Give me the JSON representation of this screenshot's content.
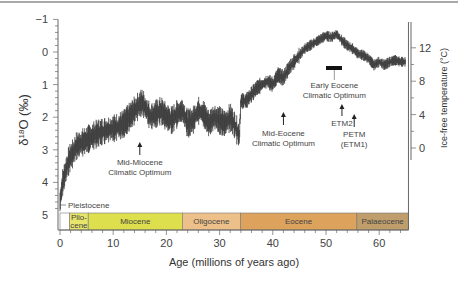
{
  "chart_data": {
    "type": "scatter",
    "title": "",
    "xlabel": "Age (millions of years ago)",
    "ylabel": "δ18O (‰)",
    "y2label": "Ice-free temperature (°C)",
    "xlim": [
      0,
      65.5
    ],
    "ylim": [
      5,
      -1
    ],
    "y2lim": [
      0,
      12
    ],
    "x_ticks": [
      0,
      10,
      20,
      30,
      40,
      50,
      60
    ],
    "y_ticks": [
      -1,
      0,
      1,
      2,
      3,
      4,
      5
    ],
    "y2_ticks": [
      0,
      4,
      8,
      12
    ],
    "grid": false,
    "series": [
      {
        "name": "Benthic δ18O",
        "x": [
          0,
          0.5,
          1,
          1.5,
          2,
          2.5,
          3,
          4,
          5,
          6,
          7,
          8,
          9,
          10,
          11,
          12,
          13,
          14,
          15,
          15.5,
          16,
          17,
          18,
          19,
          20,
          21,
          22,
          23,
          24,
          25,
          26,
          27,
          28,
          29,
          30,
          31,
          32,
          33,
          33.7,
          34,
          35,
          36,
          37,
          38,
          39,
          40,
          41,
          42,
          43,
          44,
          45,
          46,
          47,
          48,
          49,
          50,
          51,
          52,
          53,
          54,
          55,
          56,
          57,
          58,
          59,
          60,
          61,
          62,
          63,
          64,
          65
        ],
        "values": [
          4.6,
          4.0,
          3.7,
          3.4,
          3.2,
          3.1,
          2.9,
          2.8,
          2.7,
          2.6,
          2.5,
          2.45,
          2.4,
          2.35,
          2.3,
          2.2,
          2.0,
          1.8,
          1.6,
          1.55,
          1.7,
          2.0,
          1.9,
          1.8,
          2.0,
          2.1,
          1.9,
          1.8,
          2.2,
          2.1,
          1.8,
          1.9,
          2.2,
          2.0,
          2.1,
          2.2,
          2.0,
          2.3,
          2.6,
          1.5,
          1.5,
          1.3,
          1.1,
          1.0,
          0.9,
          1.0,
          0.7,
          0.8,
          0.5,
          0.3,
          0.1,
          -0.1,
          -0.2,
          -0.3,
          -0.4,
          -0.5,
          -0.45,
          -0.55,
          -0.35,
          -0.2,
          -0.1,
          0.05,
          0.1,
          0.2,
          0.4,
          0.3,
          0.4,
          0.3,
          0.25,
          0.3,
          0.3
        ]
      }
    ],
    "epochs": [
      {
        "name": "Pleistocene",
        "start": 0,
        "end": 1.8,
        "color": "#ffffff"
      },
      {
        "name": "Plio-cene",
        "start": 1.8,
        "end": 5.3,
        "color": "#e8e66a"
      },
      {
        "name": "Miocene",
        "start": 5.3,
        "end": 23,
        "color": "#dde04c"
      },
      {
        "name": "Oligocene",
        "start": 23,
        "end": 33.9,
        "color": "#edc089"
      },
      {
        "name": "Eocene",
        "start": 33.9,
        "end": 55.8,
        "color": "#dda35c"
      },
      {
        "name": "Palaeocene",
        "start": 55.8,
        "end": 65.5,
        "color": "#bf9e6c"
      }
    ],
    "annotations": [
      {
        "text": [
          "Mid-Miocene",
          "Climatic Optimum"
        ],
        "x": 15,
        "arrow_y": 2.85
      },
      {
        "text": [
          "Mid-Eocene",
          "Climatic Optimum"
        ],
        "x": 42,
        "arrow_y": 1.75
      },
      {
        "text": [
          "Early Eocene",
          "Climatic Optimum"
        ],
        "x": 51,
        "bar_y": 0.2,
        "bar_x": [
          50,
          53
        ]
      },
      {
        "text": [
          "ETM2"
        ],
        "x": 53.5,
        "arrow_y": 1.15
      },
      {
        "text": [
          "PETM",
          "(ETM1)"
        ],
        "x": 55.5,
        "arrow_y": 1.6
      },
      {
        "text": [
          "Pleistocene"
        ],
        "x": 1.3,
        "label_y": 4.6
      }
    ]
  }
}
